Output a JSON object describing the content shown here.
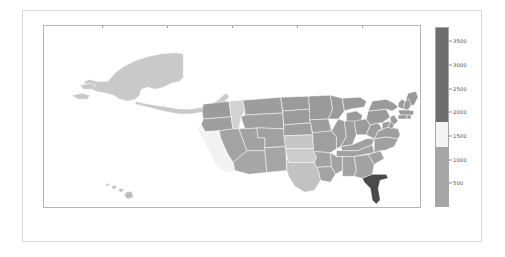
{
  "chart_data": {
    "type": "map",
    "title": "",
    "xlabel": "",
    "ylabel": "",
    "xlim": [
      -178,
      -62
    ],
    "ylim": [
      17,
      73
    ],
    "grid": false,
    "projection": "plate-carree",
    "xticks": [
      "−160",
      "−140",
      "−120",
      "−100",
      "−80"
    ],
    "xtick_values": [
      -160,
      -140,
      -120,
      -100,
      -80
    ],
    "yticks": [
      "20",
      "30",
      "40",
      "50",
      "60",
      "70"
    ],
    "ytick_values": [
      20,
      30,
      40,
      50,
      60,
      70
    ],
    "colorbar": {
      "position": "right",
      "orientation": "vertical",
      "vmin": 0,
      "vmax": 3800,
      "cmap": "gray-diverging",
      "ticks": [
        "500",
        "1000",
        "1500",
        "2000",
        "2500",
        "3000",
        "3500"
      ],
      "tick_values": [
        500,
        1000,
        1500,
        2000,
        2500,
        3000,
        3500
      ],
      "bands": [
        {
          "from": 0,
          "to": 1250,
          "color": "#a5a5a5"
        },
        {
          "from": 1250,
          "to": 1800,
          "color": "#f4f4f4"
        },
        {
          "from": 1800,
          "to": 3800,
          "color": "#6e6e6e"
        }
      ]
    },
    "regions": [
      {
        "name": "Alaska",
        "value": 620,
        "color": "#c9c9c9"
      },
      {
        "name": "Hawaii",
        "value": 900,
        "color": "#bdbdbd"
      },
      {
        "name": "Washington",
        "value": 2300,
        "color": "#9b9b9b"
      },
      {
        "name": "Oregon",
        "value": 2250,
        "color": "#9e9e9e"
      },
      {
        "name": "California",
        "value": 1480,
        "color": "#f2f2f2"
      },
      {
        "name": "Idaho",
        "value": 1650,
        "color": "#d2d2d2"
      },
      {
        "name": "Nevada",
        "value": 2150,
        "color": "#a3a3a3"
      },
      {
        "name": "Utah",
        "value": 2180,
        "color": "#a2a2a2"
      },
      {
        "name": "Arizona",
        "value": 2100,
        "color": "#a6a6a6"
      },
      {
        "name": "Montana",
        "value": 2280,
        "color": "#9d9d9d"
      },
      {
        "name": "Wyoming",
        "value": 2240,
        "color": "#9f9f9f"
      },
      {
        "name": "Colorado",
        "value": 2200,
        "color": "#a1a1a1"
      },
      {
        "name": "New Mexico",
        "value": 2120,
        "color": "#a5a5a5"
      },
      {
        "name": "North Dakota",
        "value": 2300,
        "color": "#9b9b9b"
      },
      {
        "name": "South Dakota",
        "value": 2290,
        "color": "#9c9c9c"
      },
      {
        "name": "Nebraska",
        "value": 2260,
        "color": "#9e9e9e"
      },
      {
        "name": "Kansas",
        "value": 1700,
        "color": "#c6c6c6"
      },
      {
        "name": "Oklahoma",
        "value": 1600,
        "color": "#cccccc"
      },
      {
        "name": "Texas",
        "value": 1550,
        "color": "#c2c2c2"
      },
      {
        "name": "Minnesota",
        "value": 2310,
        "color": "#9a9a9a"
      },
      {
        "name": "Iowa",
        "value": 2270,
        "color": "#9d9d9d"
      },
      {
        "name": "Missouri",
        "value": 2230,
        "color": "#9f9f9f"
      },
      {
        "name": "Arkansas",
        "value": 2180,
        "color": "#a2a2a2"
      },
      {
        "name": "Louisiana",
        "value": 2150,
        "color": "#a3a3a3"
      },
      {
        "name": "Wisconsin",
        "value": 2300,
        "color": "#9b9b9b"
      },
      {
        "name": "Illinois",
        "value": 2260,
        "color": "#9e9e9e"
      },
      {
        "name": "Michigan",
        "value": 2320,
        "color": "#9a9a9a"
      },
      {
        "name": "Indiana",
        "value": 2250,
        "color": "#9e9e9e"
      },
      {
        "name": "Ohio",
        "value": 2280,
        "color": "#9c9c9c"
      },
      {
        "name": "Kentucky",
        "value": 2230,
        "color": "#a0a0a0"
      },
      {
        "name": "Tennessee",
        "value": 2200,
        "color": "#a1a1a1"
      },
      {
        "name": "Mississippi",
        "value": 2170,
        "color": "#a3a3a3"
      },
      {
        "name": "Alabama",
        "value": 2160,
        "color": "#a3a3a3"
      },
      {
        "name": "Georgia",
        "value": 2190,
        "color": "#a2a2a2"
      },
      {
        "name": "Florida",
        "value": 3600,
        "color": "#4a4a4a"
      },
      {
        "name": "South Carolina",
        "value": 2210,
        "color": "#a1a1a1"
      },
      {
        "name": "North Carolina",
        "value": 2240,
        "color": "#a0a0a0"
      },
      {
        "name": "Virginia",
        "value": 2260,
        "color": "#9e9e9e"
      },
      {
        "name": "West Virginia",
        "value": 2270,
        "color": "#9d9d9d"
      },
      {
        "name": "Pennsylvania",
        "value": 2300,
        "color": "#9b9b9b"
      },
      {
        "name": "New York",
        "value": 2330,
        "color": "#9a9a9a"
      },
      {
        "name": "Maine",
        "value": 2350,
        "color": "#999999"
      },
      {
        "name": "Vermont",
        "value": 2340,
        "color": "#9a9a9a"
      },
      {
        "name": "New Hampshire",
        "value": 2340,
        "color": "#9a9a9a"
      },
      {
        "name": "Massachusetts",
        "value": 2320,
        "color": "#9b9b9b"
      },
      {
        "name": "Connecticut",
        "value": 2310,
        "color": "#9b9b9b"
      },
      {
        "name": "Rhode Island",
        "value": 2310,
        "color": "#9b9b9b"
      },
      {
        "name": "New Jersey",
        "value": 2300,
        "color": "#9c9c9c"
      },
      {
        "name": "Delaware",
        "value": 2290,
        "color": "#9c9c9c"
      },
      {
        "name": "Maryland",
        "value": 2280,
        "color": "#9d9d9d"
      }
    ]
  }
}
